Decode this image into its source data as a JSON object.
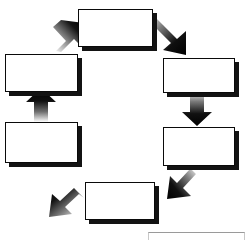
{
  "diagram": {
    "type": "cycle",
    "title": "",
    "direction": "counter-clockwise",
    "node_count": 6,
    "shape_style": "rectangle",
    "fill_color": "#ffffff",
    "border_color": "#0a0a0a",
    "shadow_color": "#131313",
    "arrow_color": "#000000",
    "nodes": [
      {
        "id": "node-top",
        "label": "",
        "position": "top",
        "x": 78,
        "y": 9,
        "w": 75,
        "h": 38
      },
      {
        "id": "node-upper-right",
        "label": "",
        "position": "upper-right",
        "x": 163,
        "y": 58,
        "w": 72,
        "h": 35
      },
      {
        "id": "node-lower-right",
        "label": "",
        "position": "lower-right",
        "x": 163,
        "y": 127,
        "w": 72,
        "h": 39
      },
      {
        "id": "node-bottom",
        "label": "",
        "position": "bottom",
        "x": 85,
        "y": 182,
        "w": 70,
        "h": 38
      },
      {
        "id": "node-lower-left",
        "label": "",
        "position": "lower-left",
        "x": 5,
        "y": 122,
        "w": 73,
        "h": 41
      },
      {
        "id": "node-upper-left",
        "label": "",
        "position": "upper-left",
        "x": 5,
        "y": 54,
        "w": 73,
        "h": 38
      }
    ],
    "arrows": [
      {
        "id": "arrow-top-to-upper-right",
        "from": "node-top",
        "to": "node-upper-right",
        "heading": "down-right"
      },
      {
        "id": "arrow-upper-right-to-lower-right",
        "from": "node-upper-right",
        "to": "node-lower-right",
        "heading": "down"
      },
      {
        "id": "arrow-lower-right-to-bottom",
        "from": "node-lower-right",
        "to": "node-bottom",
        "heading": "down-left"
      },
      {
        "id": "arrow-bottom-to-lower-left",
        "from": "node-bottom",
        "to": "node-lower-left",
        "heading": "up-left"
      },
      {
        "id": "arrow-lower-left-to-upper-left",
        "from": "node-lower-left",
        "to": "node-upper-left",
        "heading": "up"
      },
      {
        "id": "arrow-upper-left-to-top",
        "from": "node-upper-left",
        "to": "node-top",
        "heading": "up-right"
      }
    ],
    "partial_box": {
      "id": "partial-box-clipped",
      "label": "",
      "x": 148,
      "y": 232,
      "w": 97,
      "h": 8
    }
  }
}
